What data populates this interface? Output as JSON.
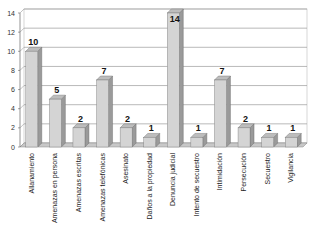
{
  "chart_data": {
    "type": "bar",
    "title": "",
    "xlabel": "",
    "ylabel": "",
    "ylim": [
      0,
      14
    ],
    "yticks": [
      0,
      2,
      4,
      6,
      8,
      10,
      12,
      14
    ],
    "grid": true,
    "legend": null,
    "style": "3d-bar",
    "categories": [
      "Allanamiento",
      "Amenazas en persona",
      "Amenazas escritas",
      "Amenazas telefónicas",
      "Asesinato",
      "Daños a la propiedad",
      "Denuncia judicial",
      "Intento de secuestro",
      "Intimidación",
      "Persecución",
      "Secuestro",
      "Vigilancia"
    ],
    "values": [
      10,
      5,
      2,
      7,
      2,
      1,
      14,
      1,
      7,
      2,
      1,
      1
    ],
    "colors": {
      "bar_front": "#d4d4d4",
      "bar_side": "#9a9a9a",
      "bar_top": "#bdbdbd",
      "grid": "#9a9a9a",
      "plot_bg": "#ffffff",
      "floor": "#c8c8c8"
    }
  }
}
